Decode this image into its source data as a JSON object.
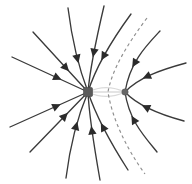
{
  "figure": {
    "type": "field-line-diagram",
    "width": 192,
    "height": 184,
    "background_color": "#ffffff"
  },
  "colors": {
    "field_line": "#3a3a3a",
    "arrow": "#2b2b2b",
    "separatrix": "#8e8e8e",
    "charge_major": "#5a5a5a",
    "charge_minor": "#666666",
    "background": "#ffffff"
  },
  "chart_data": {
    "type": "scatter",
    "xlabel": "",
    "ylabel": "",
    "xlim": [
      0,
      192
    ],
    "ylim": [
      0,
      184
    ],
    "grid": false,
    "legend": false,
    "charges": [
      {
        "name": "large-negative-charge",
        "sign": "negative",
        "relative_magnitude": 3,
        "x": 88,
        "y": 92,
        "marker": "square",
        "size": 9
      },
      {
        "name": "small-negative-charge",
        "sign": "negative",
        "relative_magnitude": 1,
        "x": 125,
        "y": 92,
        "marker": "dot",
        "size": 4
      }
    ],
    "field_lines": [
      {
        "id": "L1",
        "target": "large-negative-charge",
        "path": "M 12,57 L 88,92",
        "arrows": [
          0.55
        ]
      },
      {
        "id": "L2",
        "target": "large-negative-charge",
        "path": "M 10,127 L 88,92",
        "arrows": [
          0.55
        ]
      },
      {
        "id": "L3",
        "target": "large-negative-charge",
        "path": "M 33,32 L 88,92",
        "arrows": [
          0.55
        ]
      },
      {
        "id": "L4",
        "target": "large-negative-charge",
        "path": "M 30,152 L 88,92",
        "arrows": [
          0.55
        ]
      },
      {
        "id": "L5",
        "target": "large-negative-charge",
        "path": "M 68,8 C 72,40 78,66 88,92",
        "arrows": [
          0.55
        ]
      },
      {
        "id": "L6",
        "target": "large-negative-charge",
        "path": "M 66,178 C 70,146 77,118 88,92",
        "arrows": [
          0.55
        ]
      },
      {
        "id": "L7",
        "target": "large-negative-charge",
        "path": "M 104,6 C 96,40 90,68 88,92",
        "arrows": [
          0.5
        ]
      },
      {
        "id": "L8",
        "target": "large-negative-charge",
        "path": "M 100,180 C 94,146 89,116 88,92",
        "arrows": [
          0.52
        ]
      },
      {
        "id": "L9",
        "target": "large-negative-charge",
        "path": "M 131,14 C 112,40 96,66 88,92",
        "arrows": [
          0.52
        ]
      },
      {
        "id": "L10",
        "target": "large-negative-charge",
        "path": "M 128,170 C 110,142 96,116 88,92",
        "arrows": [
          0.52
        ]
      },
      {
        "id": "R1",
        "target": "small-negative-charge",
        "path": "M 186,63 C 160,70 138,78 125,92",
        "arrows": [
          0.55
        ]
      },
      {
        "id": "R2",
        "target": "small-negative-charge",
        "path": "M 184,121 C 158,114 137,105 125,92",
        "arrows": [
          0.55
        ]
      },
      {
        "id": "R3",
        "target": "small-negative-charge",
        "path": "M 160,31 C 146,46 130,62 125,92",
        "arrows": [
          0.52
        ]
      },
      {
        "id": "R4",
        "target": "small-negative-charge",
        "path": "M 157,152 C 144,136 129,120 125,92",
        "arrows": [
          0.52
        ]
      }
    ],
    "separatrices": [
      {
        "id": "S1",
        "style": "dashed",
        "path": "M 147,18 C 126,46 112,70 108,92 C 112,118 126,148 145,174"
      }
    ],
    "faint_lines": [
      {
        "id": "F1",
        "path": "M 88,92 C 100,86 112,86 125,92"
      },
      {
        "id": "F2",
        "path": "M 88,92 C 100,98 112,98 125,92"
      },
      {
        "id": "F3",
        "path": "M 88,92 L 125,92"
      }
    ]
  }
}
